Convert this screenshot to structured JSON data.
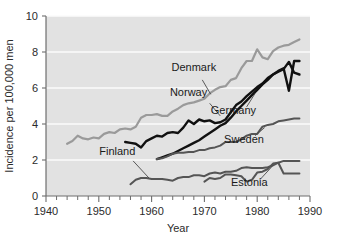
{
  "chart_data": {
    "type": "line",
    "title": "",
    "xlabel": "Year",
    "ylabel": "Incidence per 100,000 men",
    "xlim": [
      1940,
      1990
    ],
    "ylim": [
      0,
      10
    ],
    "xticks": [
      1940,
      1950,
      1960,
      1970,
      1980,
      1990
    ],
    "xtick_labels": [
      "1940",
      "1950",
      "1960",
      "1970",
      "1980",
      "1990"
    ],
    "yticks": [
      0,
      2,
      4,
      6,
      8,
      10
    ],
    "ytick_labels": [
      "0",
      "2",
      "4",
      "6",
      "8",
      "10"
    ],
    "minor_xtick_step": 2,
    "grid": "horizontal-white",
    "legend": "inline-labels-with-leader-lines",
    "plot_background": "#e2e2e2",
    "series": [
      {
        "name": "Denmark",
        "color": "#9a9a9a",
        "width": 2.2,
        "label_x": 1968.0,
        "label_y": 6.95,
        "leader_from": [
          1969.6,
          6.45
        ],
        "leader_to": [
          1971.2,
          5.65
        ],
        "x": [
          1944,
          1945,
          1946,
          1947,
          1948,
          1949,
          1950,
          1951,
          1952,
          1953,
          1954,
          1955,
          1956,
          1957,
          1958,
          1959,
          1960,
          1961,
          1962,
          1963,
          1964,
          1965,
          1966,
          1967,
          1968,
          1969,
          1970,
          1971,
          1972,
          1973,
          1974,
          1975,
          1976,
          1977,
          1978,
          1979,
          1980,
          1981,
          1982,
          1983,
          1984,
          1985,
          1986,
          1987,
          1988
        ],
        "values": [
          2.9,
          3.05,
          3.35,
          3.2,
          3.15,
          3.25,
          3.2,
          3.45,
          3.55,
          3.5,
          3.7,
          3.75,
          3.7,
          3.85,
          4.35,
          4.5,
          4.5,
          4.55,
          4.45,
          4.45,
          4.7,
          4.85,
          5.05,
          5.15,
          5.2,
          5.3,
          5.4,
          5.7,
          5.9,
          6.05,
          6.1,
          6.45,
          6.55,
          7.1,
          7.5,
          7.5,
          8.15,
          7.7,
          7.6,
          8.05,
          8.25,
          8.35,
          8.4,
          8.55,
          8.7
        ]
      },
      {
        "name": "Norway",
        "color": "#111111",
        "width": 2.4,
        "label_x": 1967.0,
        "label_y": 5.55,
        "leader_from": [
          1971.0,
          5.15
        ],
        "leader_to": [
          1973.0,
          4.45
        ],
        "x": [
          1955,
          1956,
          1957,
          1958,
          1959,
          1960,
          1961,
          1962,
          1963,
          1964,
          1965,
          1966,
          1967,
          1968,
          1969,
          1970,
          1971,
          1972,
          1973,
          1974,
          1975,
          1976,
          1977,
          1978,
          1979,
          1980,
          1981,
          1982,
          1983,
          1984,
          1985,
          1986,
          1987,
          1988
        ],
        "values": [
          3.0,
          2.95,
          2.9,
          2.7,
          3.05,
          3.2,
          3.35,
          3.3,
          3.5,
          3.55,
          3.5,
          3.8,
          4.2,
          4.0,
          4.25,
          4.15,
          4.2,
          4.05,
          4.1,
          4.25,
          4.65,
          5.05,
          5.25,
          5.55,
          5.8,
          6.05,
          6.25,
          6.55,
          6.75,
          6.9,
          7.05,
          7.45,
          6.85,
          6.75
        ]
      },
      {
        "name": "Germany",
        "color": "#111111",
        "width": 2.4,
        "label_x": 1975.5,
        "label_y": 4.55,
        "leader_from": [
          1978.0,
          4.95
        ],
        "leader_to": [
          1979.6,
          5.7
        ],
        "x": [
          1961,
          1962,
          1963,
          1964,
          1965,
          1966,
          1967,
          1968,
          1969,
          1970,
          1971,
          1972,
          1973,
          1974,
          1975,
          1976,
          1977,
          1978,
          1979,
          1980,
          1981,
          1982,
          1983,
          1984,
          1985,
          1986,
          1987,
          1988
        ],
        "values": [
          2.05,
          2.15,
          2.25,
          2.35,
          2.5,
          2.65,
          2.8,
          2.95,
          3.1,
          3.3,
          3.5,
          3.7,
          3.9,
          4.05,
          4.35,
          4.7,
          5.0,
          5.3,
          5.6,
          5.9,
          6.2,
          6.45,
          6.75,
          6.95,
          7.1,
          5.85,
          7.5,
          7.5
        ]
      },
      {
        "name": "Sweden",
        "color": "#555555",
        "width": 2.0,
        "label_x": 1977.5,
        "label_y": 2.95,
        "leader_from": [
          1979.6,
          3.35
        ],
        "leader_to": [
          1981.4,
          3.8
        ],
        "x": [
          1961,
          1962,
          1963,
          1964,
          1965,
          1966,
          1967,
          1968,
          1969,
          1970,
          1971,
          1972,
          1973,
          1974,
          1975,
          1976,
          1977,
          1978,
          1979,
          1980,
          1981,
          1982,
          1983,
          1984,
          1985,
          1986,
          1987,
          1988
        ],
        "values": [
          2.05,
          2.1,
          2.2,
          2.35,
          2.4,
          2.4,
          2.45,
          2.45,
          2.55,
          2.55,
          2.65,
          2.7,
          2.8,
          3.0,
          3.0,
          3.0,
          3.15,
          3.35,
          3.45,
          3.45,
          3.85,
          3.95,
          4.0,
          4.15,
          4.2,
          4.25,
          4.3,
          4.3
        ]
      },
      {
        "name": "Finland",
        "color": "#555555",
        "width": 2.0,
        "label_x": 1953.5,
        "label_y": 2.3,
        "leader_from": [
          1956.5,
          1.95
        ],
        "leader_to": [
          1959.5,
          1.0
        ],
        "x": [
          1956,
          1957,
          1958,
          1959,
          1960,
          1961,
          1962,
          1963,
          1964,
          1965,
          1966,
          1967,
          1968,
          1969,
          1970,
          1971,
          1972,
          1973,
          1974,
          1975,
          1976,
          1977,
          1978,
          1979,
          1980,
          1981,
          1982,
          1983,
          1984,
          1985,
          1986,
          1987,
          1988
        ],
        "values": [
          0.65,
          0.9,
          1.0,
          1.0,
          0.95,
          0.95,
          0.95,
          0.9,
          0.85,
          1.0,
          1.05,
          1.05,
          1.15,
          1.15,
          1.1,
          1.25,
          1.3,
          1.25,
          1.35,
          1.35,
          1.4,
          1.55,
          1.6,
          1.55,
          1.55,
          1.55,
          1.6,
          1.7,
          1.85,
          1.95,
          1.95,
          1.95,
          1.95
        ]
      },
      {
        "name": "Estonia",
        "color": "#555555",
        "width": 2.0,
        "label_x": 1978.5,
        "label_y": 0.55,
        "leader_from": [
          1980.5,
          0.9
        ],
        "leader_to": [
          1983.0,
          1.7
        ],
        "x": [
          1970,
          1971,
          1972,
          1973,
          1974,
          1975,
          1976,
          1977,
          1978,
          1979,
          1980,
          1981,
          1982,
          1983,
          1984,
          1985,
          1986,
          1987,
          1988
        ],
        "values": [
          0.8,
          1.0,
          0.95,
          1.0,
          1.2,
          1.2,
          1.15,
          1.1,
          0.8,
          0.9,
          1.3,
          1.35,
          1.5,
          1.8,
          1.85,
          1.25,
          1.25,
          1.25,
          1.25
        ]
      }
    ]
  }
}
